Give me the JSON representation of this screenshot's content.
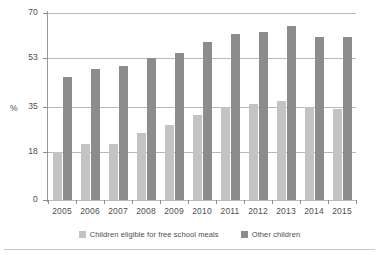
{
  "chart_data": {
    "type": "bar",
    "title": "",
    "xlabel": "",
    "ylabel": "%",
    "ylim": [
      0,
      70
    ],
    "yticks": [
      0,
      18,
      35,
      53,
      70
    ],
    "ytick_labels": [
      "0",
      "18",
      "35",
      "53",
      "70"
    ],
    "grid": true,
    "legend_position": "bottom",
    "categories": [
      "2005",
      "2006",
      "2007",
      "2008",
      "2009",
      "2010",
      "2011",
      "2012",
      "2013",
      "2014",
      "2015"
    ],
    "series": [
      {
        "name": "Children eligible for free school meals",
        "color": "#c3c3c3",
        "values": [
          18,
          21,
          21,
          25,
          28,
          32,
          35,
          36,
          37,
          35,
          34
        ]
      },
      {
        "name": "Other children",
        "color": "#8c8c8c",
        "values": [
          46,
          49,
          50,
          53,
          55,
          59,
          62,
          63,
          65,
          61,
          61
        ]
      }
    ]
  },
  "axis": {
    "y_title": "%"
  },
  "legend": {
    "entries": [
      {
        "label": "Children eligible for free school meals",
        "swatch": "series-a-swatch"
      },
      {
        "label": "Other children",
        "swatch": "series-b-swatch"
      }
    ]
  }
}
